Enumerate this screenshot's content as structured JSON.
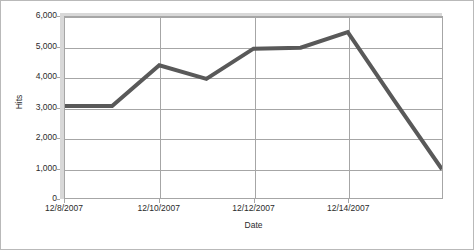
{
  "chart_data": {
    "type": "line",
    "title": "",
    "xlabel": "Date",
    "ylabel": "Hits",
    "grid": true,
    "legend": false,
    "line_color": "#595959",
    "line_width": 4,
    "ylim": [
      0,
      6000
    ],
    "ytick_labels": [
      "6,000",
      "5,000",
      "4,000",
      "3,000",
      "2,000",
      "1,000",
      "0"
    ],
    "ytick_values": [
      6000,
      5000,
      4000,
      3000,
      2000,
      1000,
      0
    ],
    "xtick_labels": [
      "12/8/2007",
      "12/10/2007",
      "12/12/2007",
      "12/14/2007"
    ],
    "xtick_indices": [
      0,
      2,
      4,
      6
    ],
    "x": [
      "12/8/2007",
      "12/9/2007",
      "12/10/2007",
      "12/11/2007",
      "12/12/2007",
      "12/13/2007",
      "12/14/2007",
      "12/15/2007",
      "12/16/2007"
    ],
    "series": [
      {
        "name": "Hits",
        "values": [
          3050,
          3050,
          4400,
          3950,
          4950,
          4980,
          5500,
          3200,
          950
        ]
      }
    ]
  },
  "axes": {
    "y_label": "Hits",
    "x_label": "Date"
  },
  "colors": {
    "line": "#595959",
    "gridline": "#a6a6a6",
    "plot_background": "#ffffff",
    "frame_border": "#b9b9b9",
    "bevel_shadow": "#d8d8d8",
    "text": "#2b2b2b"
  }
}
